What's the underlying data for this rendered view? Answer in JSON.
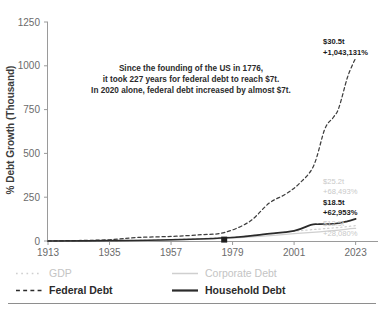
{
  "chart_data": {
    "type": "line",
    "title": "",
    "xlabel": "",
    "ylabel": "% Debt Growth (Thousand)",
    "xlim": [
      1913,
      2031
    ],
    "ylim": [
      0,
      1250
    ],
    "grid": false,
    "legend_position": "bottom-left",
    "xticks": [
      "1913",
      "1935",
      "1957",
      "1979",
      "2001",
      "2023"
    ],
    "xtick_values": [
      1913,
      1935,
      1957,
      1979,
      2001,
      2023
    ],
    "yticks": [
      "0",
      "250",
      "500",
      "750",
      "1000",
      "1250"
    ],
    "ytick_values": [
      0,
      250,
      500,
      750,
      1000,
      1250
    ],
    "annotation": {
      "line1": "Since the founding of the US in 1776,",
      "line2": "it took 227 years for federal debt to reach $7t.",
      "line3": "In 2020 alone, federal debt increased by almost $7t."
    },
    "marker": {
      "label": "1976-marker",
      "x": 1976,
      "y": 8
    },
    "series": [
      {
        "name": "GDP",
        "style": "dotted",
        "color": "#d0d0d0",
        "end_label_value": "$25.2t",
        "end_label_growth": "+68,493%",
        "x": [
          1913,
          1935,
          1957,
          1979,
          1990,
          2001,
          2010,
          2016,
          2020,
          2023
        ],
        "values": [
          0,
          2,
          8,
          22,
          38,
          56,
          68,
          76,
          82,
          88
        ]
      },
      {
        "name": "Corporate Debt",
        "style": "solid",
        "color": "#cfcfcf",
        "end_label_value": "$12.5t",
        "end_label_growth": "+28,080%",
        "x": [
          1913,
          1935,
          1957,
          1979,
          1990,
          2001,
          2010,
          2016,
          2020,
          2023
        ],
        "values": [
          0,
          1,
          5,
          16,
          28,
          42,
          52,
          60,
          68,
          72
        ]
      },
      {
        "name": "Federal Debt",
        "style": "dashed",
        "color": "#3d3d3d",
        "end_label_value": "$30.5t",
        "end_label_growth": "+1,043,131%",
        "x": [
          1913,
          1925,
          1935,
          1945,
          1957,
          1968,
          1976,
          1985,
          1992,
          1998,
          2003,
          2008,
          2012,
          2015,
          2017,
          2020,
          2022,
          2023
        ],
        "values": [
          0,
          3,
          7,
          20,
          26,
          36,
          48,
          110,
          215,
          268,
          330,
          430,
          640,
          705,
          760,
          930,
          1010,
          1043
        ]
      },
      {
        "name": "Household Debt",
        "style": "solid",
        "color": "#2a2a2a",
        "end_label_value": "$18.5t",
        "end_label_growth": "+62,953%",
        "x": [
          1913,
          1935,
          1957,
          1979,
          1990,
          2001,
          2007,
          2010,
          2016,
          2020,
          2023
        ],
        "values": [
          0,
          2,
          7,
          20,
          38,
          58,
          92,
          96,
          100,
          112,
          126
        ]
      }
    ],
    "legend": [
      {
        "label": "GDP",
        "style": "dotted",
        "tone": "faint"
      },
      {
        "label": "Corporate Debt",
        "style": "solid",
        "tone": "faint"
      },
      {
        "label": "Federal Debt",
        "style": "dashed",
        "tone": "strong"
      },
      {
        "label": "Household Debt",
        "style": "solid",
        "tone": "strong"
      }
    ]
  }
}
